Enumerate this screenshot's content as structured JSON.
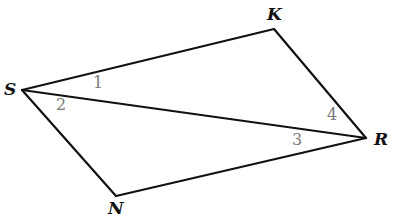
{
  "diagram": {
    "vertices": {
      "S": {
        "label": "S",
        "x": 22,
        "y": 90
      },
      "K": {
        "label": "K",
        "x": 274,
        "y": 29
      },
      "R": {
        "label": "R",
        "x": 366,
        "y": 138
      },
      "N": {
        "label": "N",
        "x": 116,
        "y": 196
      }
    },
    "edges": [
      [
        "S",
        "K"
      ],
      [
        "K",
        "R"
      ],
      [
        "R",
        "N"
      ],
      [
        "N",
        "S"
      ],
      [
        "S",
        "R"
      ]
    ],
    "angles": [
      {
        "label": "1",
        "at": "S",
        "between": [
          "SK",
          "SR"
        ]
      },
      {
        "label": "2",
        "at": "S",
        "between": [
          "SR",
          "SN"
        ]
      },
      {
        "label": "3",
        "at": "R",
        "between": [
          "RS",
          "RN"
        ]
      },
      {
        "label": "4",
        "at": "R",
        "between": [
          "RK",
          "RS"
        ]
      }
    ],
    "colors": {
      "line": "#111111",
      "angle_label": "#7a7a7a",
      "vertex_label": "#111111"
    }
  }
}
